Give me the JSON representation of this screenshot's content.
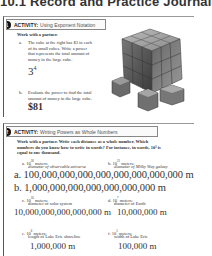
{
  "header": {
    "title": "10.1 Record and Practice Journal"
  },
  "activity1": {
    "number": "1",
    "label": "ACTIVITY:",
    "title": "Using Exponent Notation",
    "intro": "Work with a partner.",
    "part_a": {
      "letter": "a.",
      "lines": [
        "The cube at the right has $3 in each",
        "of its small cubes. Write a power",
        "that represents the total amount of",
        "money in the large cube."
      ],
      "answer_base": "3",
      "answer_exp": "4"
    },
    "part_b": {
      "letter": "b.",
      "lines": [
        "Evaluate the power to find the total",
        "amount of money in the large cube."
      ],
      "answer": "$81"
    },
    "image": "stacked-cubes-image"
  },
  "activity2": {
    "number": "2",
    "label": "ACTIVITY:",
    "title": "Writing Powers as Whole Numbers",
    "intro_lines": [
      "Work with a partner. Write each distance as a whole number. Which",
      "numbers do you know how to write in words? For instance, in words, 10³ is",
      "equal to one thousand."
    ],
    "items": [
      {
        "letter": "a.",
        "power_base": "10",
        "power_exp": "26",
        "unit": "meters:",
        "desc": "diameter of observable universe",
        "answer": "a. 100,000,000,000,000,000,000,000,000 m"
      },
      {
        "letter": "b.",
        "power_base": "10",
        "power_exp": "21",
        "unit": "meters:",
        "desc": "diameter of Milky Way galaxy",
        "answer": "b. 1,000,000,000,000,000,000,000 m"
      },
      {
        "letter": "c.",
        "power_base": "10",
        "power_exp": "16",
        "unit": "meters:",
        "desc": "diameter of solar system",
        "answer": "10,000,000,000,000,000 m"
      },
      {
        "letter": "d.",
        "power_base": "10",
        "power_exp": "7",
        "unit": "meters:",
        "desc": "diameter of Earth",
        "answer": "10,000,000 m"
      },
      {
        "letter": "e.",
        "power_base": "10",
        "power_exp": "6",
        "unit": "meters:",
        "desc": "length of Lake Erie shoreline",
        "answer": "1,000,000 m"
      },
      {
        "letter": "f.",
        "power_base": "10",
        "power_exp": "5",
        "unit": "meters:",
        "desc": "width of Lake Erie",
        "answer": "100,000 m"
      }
    ]
  }
}
